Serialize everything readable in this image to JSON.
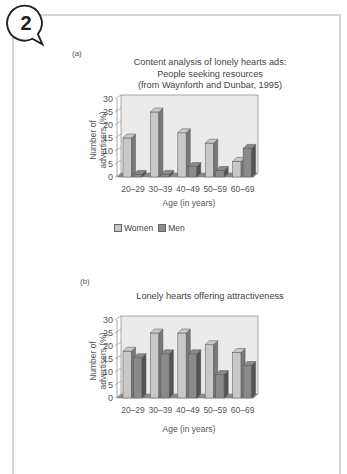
{
  "badge": {
    "number": "2"
  },
  "chart_data": [
    {
      "panel": "(a)",
      "type": "bar",
      "title": "Content analysis of lonely hearts ads: People seeking resources (from Waynforth and Dunbar, 1995)",
      "title_lines": [
        "Content analysis of lonely hearts ads:",
        "People seeking resources",
        "(from Waynforth and Dunbar, 1995)"
      ],
      "xlabel": "Age (in years)",
      "ylabel": "Number of advertisers (%)",
      "ylabel_lines": [
        "Number of",
        "advertisers (%)"
      ],
      "categories": [
        "20–29",
        "30–39",
        "40–49",
        "50–59",
        "60–69"
      ],
      "series": [
        {
          "name": "Women",
          "values": [
            15,
            25,
            17,
            13,
            6
          ],
          "color": "#c8c8c8"
        },
        {
          "name": "Men",
          "values": [
            1,
            1,
            4,
            2.5,
            11
          ],
          "color": "#8a8a8a"
        }
      ],
      "yticks": [
        0,
        5,
        10,
        15,
        20,
        25,
        30
      ],
      "ylim": [
        0,
        30
      ],
      "legend": [
        "Women",
        "Men"
      ],
      "legend_position": "bottom"
    },
    {
      "panel": "(b)",
      "type": "bar",
      "title": "Lonely hearts offering attractiveness",
      "title_lines": [
        "Lonely hearts offering attractiveness"
      ],
      "xlabel": "Age (in years)",
      "ylabel": "Number of advertisers (%)",
      "ylabel_lines": [
        "Number of",
        "advertisers (%)"
      ],
      "categories": [
        "20–29",
        "30–39",
        "40–49",
        "50–59",
        "60–69"
      ],
      "series": [
        {
          "name": "Women",
          "values": [
            18,
            25,
            25,
            20.5,
            17.5
          ],
          "color": "#c8c8c8"
        },
        {
          "name": "Men",
          "values": [
            15.5,
            17,
            17,
            9,
            12.5
          ],
          "color": "#8a8a8a"
        }
      ],
      "yticks": [
        0,
        5,
        10,
        15,
        20,
        25,
        30
      ],
      "ylim": [
        0,
        30
      ]
    }
  ],
  "legend": {
    "women": "Women",
    "men": "Men"
  }
}
